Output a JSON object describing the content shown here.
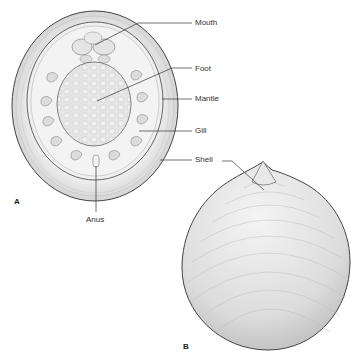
{
  "figure": {
    "panels": [
      {
        "id": "A",
        "label": "A",
        "view": "ventral view of shell interior with body"
      },
      {
        "id": "B",
        "label": "B",
        "view": "dorsal view of conical shell"
      }
    ],
    "labels": {
      "mouth": "Mouth",
      "foot": "Foot",
      "mantle": "Mantle",
      "gill": "Gill",
      "shell_a": "Shell",
      "anus": "Anus"
    },
    "colors": {
      "outline": "#444444",
      "shell_fill": "#d9d9d9",
      "mantle_fill": "#eeeeee",
      "foot_fill": "#e2e2e2",
      "leader_line": "#333333",
      "text": "#333333"
    }
  }
}
